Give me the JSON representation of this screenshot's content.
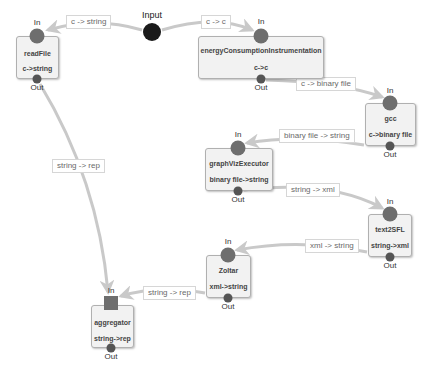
{
  "diagram": {
    "type": "dataflow-pipeline",
    "colors": {
      "edge": "#c9c9c9",
      "node_fill": "#f2f2f2",
      "node_border": "#b0b0b0",
      "in_port": "#6e6e6e",
      "out_port": "#555555",
      "input_node": "#1a1a1a"
    },
    "port_labels": {
      "in": "In",
      "out": "Out"
    },
    "source": {
      "label": "Input"
    },
    "nodes": [
      {
        "id": "readFile",
        "name": "readFile",
        "type": "c->string"
      },
      {
        "id": "energy",
        "name": "energyConsumptionInstrumentation",
        "type": "c->c"
      },
      {
        "id": "gcc",
        "name": "gcc",
        "type": "c->binary file"
      },
      {
        "id": "graphViz",
        "name": "graphVizExecutor",
        "type": "binary file->string"
      },
      {
        "id": "text2SFL",
        "name": "text2SFL",
        "type": "string->xml"
      },
      {
        "id": "zoltar",
        "name": "Zoltar",
        "type": "xml->string"
      },
      {
        "id": "aggregator",
        "name": "aggregator",
        "type": "string->rep"
      }
    ],
    "edges": [
      {
        "from": "Input",
        "to": "readFile",
        "label": "c -> string"
      },
      {
        "from": "Input",
        "to": "energyConsumptionInstrumentation",
        "label": "c -> c"
      },
      {
        "from": "energyConsumptionInstrumentation",
        "to": "gcc",
        "label": "c -> binary file"
      },
      {
        "from": "gcc",
        "to": "graphVizExecutor",
        "label": "binary file -> string"
      },
      {
        "from": "graphVizExecutor",
        "to": "text2SFL",
        "label": "string -> xml"
      },
      {
        "from": "text2SFL",
        "to": "Zoltar",
        "label": "xml -> string"
      },
      {
        "from": "Zoltar",
        "to": "aggregator",
        "label": "string -> rep"
      },
      {
        "from": "readFile",
        "to": "aggregator",
        "label": "string -> rep"
      }
    ]
  }
}
